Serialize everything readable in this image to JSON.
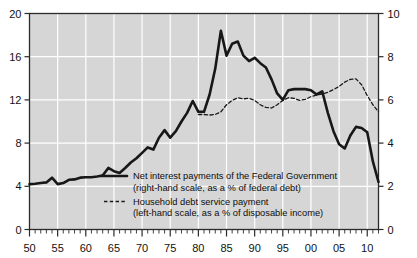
{
  "chart_data": {
    "type": "line",
    "title": "",
    "subtitle": "",
    "xlabel": "",
    "ylabel": "",
    "grid": true,
    "legend_position": "inside-center-lower",
    "background": "#d6d6d6",
    "gridline_color": "#ffffff",
    "frame_color": "#2b2b2b",
    "x": [
      1950,
      1951,
      1952,
      1953,
      1954,
      1955,
      1956,
      1957,
      1958,
      1959,
      1960,
      1961,
      1962,
      1963,
      1964,
      1965,
      1966,
      1967,
      1968,
      1969,
      1970,
      1971,
      1972,
      1973,
      1974,
      1975,
      1976,
      1977,
      1978,
      1979,
      1980,
      1981,
      1982,
      1983,
      1984,
      1985,
      1986,
      1987,
      1988,
      1989,
      1990,
      1991,
      1992,
      1993,
      1994,
      1995,
      1996,
      1997,
      1998,
      1999,
      2000,
      2001,
      2002,
      2003,
      2004,
      2005,
      2006,
      2007,
      2008,
      2009,
      2010,
      2011,
      2012
    ],
    "xlim": [
      1950,
      2012
    ],
    "xticks": [
      1950,
      1955,
      1960,
      1965,
      1970,
      1975,
      1980,
      1985,
      1990,
      1995,
      2000,
      2005,
      2010
    ],
    "xticklabels": [
      "50",
      "55",
      "60",
      "65",
      "70",
      "75",
      "80",
      "85",
      "90",
      "95",
      "00",
      "05",
      "10"
    ],
    "xtick_minor_step": 1,
    "left_axis": {
      "label": "",
      "lim": [
        0,
        20
      ],
      "ticks": [
        0,
        4,
        8,
        12,
        16,
        20
      ],
      "ticklabels": [
        "0",
        "4",
        "8",
        "12",
        "16",
        "20"
      ],
      "applies_to": "Household debt service payment"
    },
    "right_axis": {
      "label": "",
      "lim": [
        0,
        10
      ],
      "ticks": [
        0,
        2,
        4,
        6,
        8,
        10
      ],
      "ticklabels": [
        "0",
        "2",
        "4",
        "6",
        "8",
        "10"
      ],
      "applies_to": "Net interest payments of the Federal Government"
    },
    "series": [
      {
        "name": "Net interest payments of the Federal Government",
        "legend_line1": "Net interest payments of the Federal Government",
        "legend_line2": "(right-hand scale, as a % of federal debt)",
        "style": "solid",
        "color": "#171717",
        "width": 2.6,
        "axis": "right",
        "units": "% of federal debt",
        "x": [
          1950,
          1951,
          1952,
          1953,
          1954,
          1955,
          1956,
          1957,
          1958,
          1959,
          1960,
          1961,
          1962,
          1963,
          1964,
          1965,
          1966,
          1967,
          1968,
          1969,
          1970,
          1971,
          1972,
          1973,
          1974,
          1975,
          1976,
          1977,
          1978,
          1979,
          1980,
          1981,
          1982,
          1983,
          1984,
          1985,
          1986,
          1987,
          1988,
          1989,
          1990,
          1991,
          1992,
          1993,
          1994,
          1995,
          1996,
          1997,
          1998,
          1999,
          2000,
          2001,
          2002,
          2003,
          2004,
          2005,
          2006,
          2007,
          2008,
          2009,
          2010,
          2011,
          2012
        ],
        "values_right_scale": [
          2.1,
          2.12,
          2.15,
          2.18,
          2.4,
          2.1,
          2.15,
          2.3,
          2.32,
          2.4,
          2.42,
          2.42,
          2.45,
          2.5,
          2.85,
          2.7,
          2.62,
          2.85,
          3.1,
          3.3,
          3.55,
          3.8,
          3.7,
          4.25,
          4.6,
          4.25,
          4.55,
          5.0,
          5.4,
          5.95,
          5.45,
          5.45,
          6.25,
          7.45,
          9.2,
          8.05,
          8.6,
          8.7,
          8.05,
          7.8,
          7.95,
          7.7,
          7.5,
          6.95,
          6.3,
          6.0,
          6.45,
          6.5,
          6.5,
          6.5,
          6.45,
          6.25,
          6.4,
          5.4,
          4.55,
          3.95,
          3.75,
          4.35,
          4.75,
          4.7,
          4.5,
          3.15,
          2.2
        ],
        "values_plot_left_scale": [
          4.2,
          4.24,
          4.3,
          4.36,
          4.8,
          4.2,
          4.3,
          4.6,
          4.64,
          4.8,
          4.84,
          4.84,
          4.9,
          5.0,
          5.7,
          5.4,
          5.24,
          5.7,
          6.2,
          6.6,
          7.1,
          7.6,
          7.4,
          8.5,
          9.2,
          8.5,
          9.1,
          10.0,
          10.8,
          11.9,
          10.9,
          10.9,
          12.5,
          14.9,
          18.4,
          16.1,
          17.2,
          17.4,
          16.1,
          15.6,
          15.9,
          15.4,
          15.0,
          13.9,
          12.6,
          12.0,
          12.9,
          13.0,
          13.0,
          13.0,
          12.9,
          12.5,
          12.8,
          10.8,
          9.1,
          7.9,
          7.5,
          8.7,
          9.5,
          9.4,
          9.0,
          6.3,
          4.4
        ]
      },
      {
        "name": "Household debt service payment",
        "legend_line1": "Household debt service payment",
        "legend_line2": "(left-hand scale, as a % of disposable income)",
        "style": "dashed",
        "color": "#1a1a1a",
        "width": 1.3,
        "axis": "left",
        "units": "% of disposable income",
        "x": [
          1980,
          1981,
          1982,
          1983,
          1984,
          1985,
          1986,
          1987,
          1988,
          1989,
          1990,
          1991,
          1992,
          1993,
          1994,
          1995,
          1996,
          1997,
          1998,
          1999,
          2000,
          2001,
          2002,
          2003,
          2004,
          2005,
          2006,
          2007,
          2008,
          2009,
          2010,
          2011,
          2012
        ],
        "values_left_scale": [
          10.65,
          10.65,
          10.6,
          10.65,
          10.9,
          11.55,
          11.95,
          12.2,
          12.1,
          12.15,
          11.95,
          11.55,
          11.3,
          11.25,
          11.55,
          11.95,
          12.2,
          12.15,
          11.95,
          12.05,
          12.3,
          12.45,
          12.55,
          12.7,
          12.95,
          13.25,
          13.65,
          13.9,
          13.95,
          13.4,
          12.4,
          11.55,
          10.9
        ]
      }
    ]
  }
}
